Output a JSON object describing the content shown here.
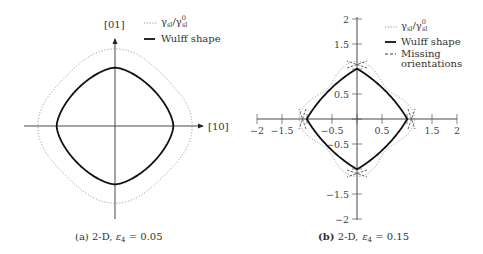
{
  "chart_data": [
    {
      "type": "line",
      "panel": "a",
      "caption": "(a) 2-D, ε4 = 0.05",
      "caption_prefix": "(a) 2-D, ",
      "caption_eps": "ε",
      "caption_sub": "4",
      "caption_value": " = 0.05",
      "epsilon4": 0.05,
      "axes": {
        "x_label": "[10]",
        "y_label": "[01]",
        "ticks": false
      },
      "legend": [
        {
          "label": "γsl/γ0sl",
          "style": "dotted"
        },
        {
          "label": "Wulff shape",
          "style": "solid"
        }
      ],
      "series": [
        {
          "name": "γsl/γ0sl",
          "form": "1 + ε4·cos(4θ) polar plot",
          "radius_axes": 1.05,
          "radius_diagonal": 0.95
        },
        {
          "name": "Wulff shape",
          "form": "rounded square, extent ≈ 0.79 of γ axis radius"
        }
      ]
    },
    {
      "type": "line",
      "panel": "b",
      "caption": "(b) 2-D, ε4 = 0.15",
      "caption_prefix": "(b) 2-D, ",
      "caption_eps": "ε",
      "caption_sub": "4",
      "caption_value": " = 0.15",
      "epsilon4": 0.15,
      "xlim": [
        -2,
        2
      ],
      "ylim": [
        -2,
        2
      ],
      "x_ticks": [
        -2,
        -1.5,
        -1,
        -0.5,
        0,
        0.5,
        1,
        1.5,
        2
      ],
      "x_tick_labels": [
        "−2",
        "−1.5",
        "",
        "−0.5",
        "",
        "0.5",
        "",
        "1.5",
        "2"
      ],
      "y_ticks": [
        2,
        1.5,
        1,
        0.5,
        0,
        -0.5,
        -1,
        -1.5,
        -2
      ],
      "y_tick_labels": [
        "2",
        "1.5",
        "",
        "0.5",
        "",
        "−0.5",
        "",
        "−1.5",
        "−2"
      ],
      "legend": [
        {
          "label": "γsl/γ0sl",
          "style": "dotted"
        },
        {
          "label": "Wulff shape",
          "style": "solid"
        },
        {
          "label": "Missing orientations",
          "style": "dashed"
        }
      ],
      "series": [
        {
          "name": "γsl/γ0sl",
          "form": "1 + ε4·cos(4θ)",
          "radius_axes": 1.15,
          "radius_diagonal": 0.85
        },
        {
          "name": "Wulff shape",
          "vertices": [
            [
              1.08,
              0
            ],
            [
              0,
              1.08
            ],
            [
              -1.08,
              0
            ],
            [
              0,
              -1.08
            ]
          ]
        },
        {
          "name": "Missing orientations",
          "near_points": [
            [
              1.1,
              0
            ],
            [
              0,
              1.1
            ],
            [
              -1.1,
              0
            ],
            [
              0,
              -1.1
            ]
          ]
        }
      ]
    }
  ],
  "legend_a": {
    "gamma": "γ",
    "gamma_sub": "sl",
    "slash": "/",
    "gamma0": "γ",
    "gamma0_sup": "0",
    "gamma0_sub": "sl",
    "wulff": "Wulff shape"
  },
  "legend_b": {
    "gamma": "γ",
    "gamma_sub": "sl",
    "slash": "/",
    "gamma0": "γ",
    "gamma0_sup": "0",
    "gamma0_sub": "sl",
    "wulff": "Wulff shape",
    "missing_1": "Missing",
    "missing_2": "orientations"
  },
  "axes_a": {
    "x_label": "[10]",
    "y_label": "[01]"
  },
  "colors": {
    "curve": "#111111",
    "axis": "#333333",
    "dotted": "#8a8a8a"
  }
}
